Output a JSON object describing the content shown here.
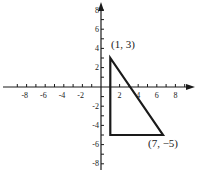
{
  "diagram": {
    "type": "coordinate-plane-triangle",
    "x_axis": {
      "min": -9,
      "max": 9,
      "tick_labels": [
        "-8",
        "-6",
        "-4",
        "-2",
        "2",
        "4",
        "6",
        "8"
      ]
    },
    "y_axis": {
      "min": -9,
      "max": 9,
      "tick_labels": [
        "8",
        "6",
        "4",
        "2",
        "-2",
        "-4",
        "-6",
        "-8"
      ]
    },
    "triangle": {
      "vertices": [
        [
          1,
          3
        ],
        [
          1,
          -5
        ],
        [
          7,
          -5
        ]
      ],
      "labels": {
        "top": "(1, 3)",
        "bottom_right": "(7, −5)"
      }
    },
    "colors": {
      "stroke": "#1a1a1a",
      "background": "#ffffff"
    }
  }
}
